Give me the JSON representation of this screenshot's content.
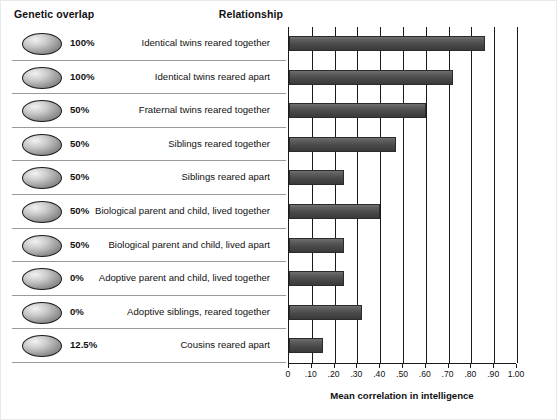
{
  "headers": {
    "genetic_overlap": "Genetic overlap",
    "relationship": "Relationship"
  },
  "axis": {
    "title": "Mean correlation in intelligence",
    "ticks": [
      "0",
      ".10",
      ".20",
      ".30",
      ".40",
      ".50",
      ".60",
      ".70",
      ".80",
      ".90",
      "1.00"
    ]
  },
  "chart_data": {
    "type": "bar",
    "orientation": "horizontal",
    "title": "",
    "xlabel": "Mean correlation in intelligence",
    "ylabel": "",
    "xlim": [
      0,
      1.0
    ],
    "xticks": [
      0,
      0.1,
      0.2,
      0.3,
      0.4,
      0.5,
      0.6,
      0.7,
      0.8,
      0.9,
      1.0
    ],
    "xticklabels": [
      "0",
      ".10",
      ".20",
      ".30",
      ".40",
      ".50",
      ".60",
      ".70",
      ".80",
      ".90",
      "1.00"
    ],
    "grid": true,
    "legend": "none",
    "categories": [
      "Identical twins reared together",
      "Identical twins reared apart",
      "Fraternal twins reared together",
      "Siblings reared together",
      "Siblings reared apart",
      "Biological parent and child, lived together",
      "Biological parent and child, lived apart",
      "Adoptive parent and child, lived together",
      "Adoptive siblings, reared together",
      "Cousins reared apart"
    ],
    "values": [
      0.86,
      0.72,
      0.6,
      0.47,
      0.24,
      0.4,
      0.24,
      0.24,
      0.32,
      0.15
    ],
    "genetic_overlap": [
      "100%",
      "100%",
      "50%",
      "50%",
      "50%",
      "50%",
      "50%",
      "0%",
      "0%",
      "12.5%"
    ],
    "bar_color": "#4a4a4a"
  }
}
